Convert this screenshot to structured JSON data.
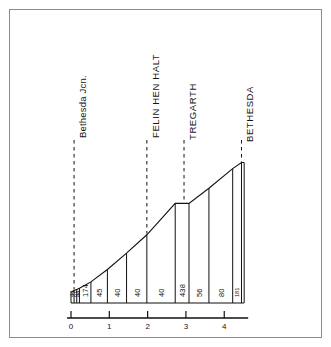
{
  "figure": {
    "kind": "railway-gradient-profile",
    "background_color": "#ffffff",
    "ink_color": "#111111",
    "frame_color": "#8c8c8c"
  },
  "chart_data": {
    "type": "line",
    "title": "",
    "subtitle": "",
    "xlabel": "",
    "ylabel": "",
    "xlim": [
      0,
      4.62
    ],
    "ylim": [
      0,
      1
    ],
    "grid": false,
    "legend": false,
    "x_ticks": [
      "0",
      "1",
      "2",
      "3",
      "4"
    ],
    "x_tick_values": [
      0,
      1,
      2,
      3,
      4
    ],
    "x_unit": "miles",
    "series": [
      {
        "name": "Rail level",
        "x": [
          0.0,
          0.08,
          0.15,
          0.22,
          0.52,
          0.95,
          1.45,
          1.98,
          2.72,
          3.08,
          3.6,
          4.22,
          4.45,
          4.52
        ],
        "y": [
          0.072,
          0.082,
          0.09,
          0.098,
          0.14,
          0.222,
          0.33,
          0.452,
          0.66,
          0.66,
          0.76,
          0.89,
          0.93,
          0.93
        ]
      }
    ],
    "sections": [
      {
        "label": "44",
        "ratio": "1 in 44",
        "x_start": 0.0,
        "x_end": 0.08,
        "narrow": true
      },
      {
        "label": "67",
        "ratio": "1 in 67",
        "x_start": 0.08,
        "x_end": 0.15,
        "narrow": true
      },
      {
        "label": "44",
        "ratio": "1 in 44",
        "x_start": 0.15,
        "x_end": 0.22,
        "narrow": true
      },
      {
        "label": "174",
        "ratio": "1 in 174",
        "x_start": 0.22,
        "x_end": 0.52,
        "narrow": false
      },
      {
        "label": "45",
        "ratio": "1 in 45",
        "x_start": 0.52,
        "x_end": 0.95,
        "narrow": false
      },
      {
        "label": "40",
        "ratio": "1 in 40",
        "x_start": 0.95,
        "x_end": 1.45,
        "narrow": false
      },
      {
        "label": "40",
        "ratio": "1 in 40",
        "x_start": 1.45,
        "x_end": 1.98,
        "narrow": false
      },
      {
        "label": "40",
        "ratio": "1 in 40",
        "x_start": 1.98,
        "x_end": 2.72,
        "narrow": false
      },
      {
        "label": "438",
        "ratio": "1 in 438",
        "x_start": 2.72,
        "x_end": 3.08,
        "narrow": false
      },
      {
        "label": "56",
        "ratio": "1 in 56",
        "x_start": 3.08,
        "x_end": 3.6,
        "narrow": false
      },
      {
        "label": "80",
        "ratio": "1 in 80",
        "x_start": 3.6,
        "x_end": 4.22,
        "narrow": false
      },
      {
        "label": "181",
        "ratio": "1 in 181",
        "x_start": 4.22,
        "x_end": 4.45,
        "narrow": true
      }
    ],
    "stations": [
      {
        "name": "Bethesda Jcn.",
        "x": 0.08,
        "case": "mixed"
      },
      {
        "name": "FELIN HEN HALT",
        "x": 1.98,
        "case": "upper"
      },
      {
        "name": "TREGARTH",
        "x": 2.95,
        "case": "upper"
      },
      {
        "name": "BETHESDA",
        "x": 4.45,
        "case": "upper"
      }
    ]
  }
}
